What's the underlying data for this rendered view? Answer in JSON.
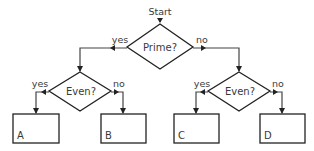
{
  "flowchart": {
    "start": {
      "label": "Start"
    },
    "decisions": [
      {
        "id": "prime",
        "label": "Prime?"
      },
      {
        "id": "even_left",
        "label": "Even?"
      },
      {
        "id": "even_right",
        "label": "Even?"
      }
    ],
    "edges": [
      {
        "from": "prime",
        "to": "even_left",
        "label": "yes"
      },
      {
        "from": "prime",
        "to": "even_right",
        "label": "no"
      },
      {
        "from": "even_left",
        "to": "box_a",
        "label": "yes"
      },
      {
        "from": "even_left",
        "to": "box_b",
        "label": "no"
      },
      {
        "from": "even_right",
        "to": "box_c",
        "label": "yes"
      },
      {
        "from": "even_right",
        "to": "box_d",
        "label": "no"
      }
    ],
    "outcomes": [
      {
        "id": "box_a",
        "label": "A"
      },
      {
        "id": "box_b",
        "label": "B"
      },
      {
        "id": "box_c",
        "label": "C"
      },
      {
        "id": "box_d",
        "label": "D"
      }
    ],
    "colors": {
      "stroke": "#222222",
      "text": "#3a3a3a",
      "background": "#ffffff"
    }
  }
}
